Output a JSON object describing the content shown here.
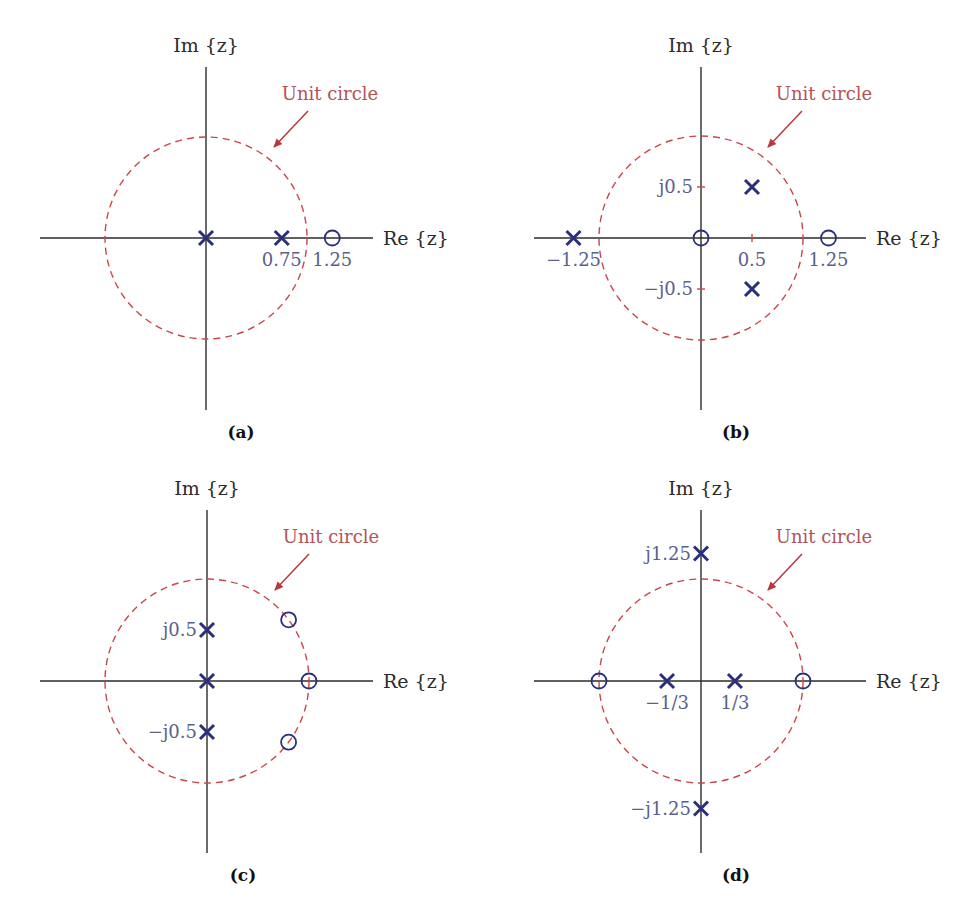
{
  "figure": {
    "panels": [
      {
        "id": "a",
        "caption": "(a)",
        "origin": [
          206,
          238
        ],
        "scale": 101,
        "v_axis": [
          67,
          410
        ],
        "h_axis": [
          40,
          373
        ],
        "im_label": "Im {z}",
        "re_label": "Re {z}",
        "circle_label": "Unit circle",
        "label_pos": [
          330,
          100
        ],
        "arrow": [
          308,
          111,
          274,
          147
        ],
        "caption_pos": [
          241,
          438
        ],
        "ticks": [],
        "poles": [
          [
            0,
            0
          ],
          [
            0.75,
            0
          ]
        ],
        "zeros": [
          [
            1.25,
            0
          ]
        ],
        "labels": [
          {
            "text": "0.75",
            "re": 0.75,
            "im": 0,
            "dx": 0,
            "dy": 28,
            "anchor": "middle"
          },
          {
            "text": "1.25",
            "re": 1.25,
            "im": 0,
            "dx": 0,
            "dy": 28,
            "anchor": "middle"
          }
        ]
      },
      {
        "id": "b",
        "caption": "(b)",
        "origin": [
          701,
          238
        ],
        "scale": 102,
        "v_axis": [
          67,
          410
        ],
        "h_axis": [
          534,
          866
        ],
        "im_label": "Im {z}",
        "re_label": "Re {z}",
        "circle_label": "Unit circle",
        "label_pos": [
          824,
          100
        ],
        "arrow": [
          802,
          111,
          768,
          147
        ],
        "caption_pos": [
          736,
          438
        ],
        "ticks": [
          [
            0,
            0.5,
            "v"
          ],
          [
            0,
            -0.5,
            "v"
          ],
          [
            0.5,
            0,
            "h"
          ]
        ],
        "poles": [
          [
            -1.25,
            0
          ],
          [
            0.5,
            0.5
          ],
          [
            0.5,
            -0.5
          ]
        ],
        "zeros": [
          [
            0,
            0
          ],
          [
            1.25,
            0
          ]
        ],
        "labels": [
          {
            "text": "−1.25",
            "re": -1.25,
            "im": 0,
            "dx": 0,
            "dy": 28,
            "anchor": "middle"
          },
          {
            "text": "0.5",
            "re": 0.5,
            "im": 0,
            "dx": 0,
            "dy": 28,
            "anchor": "middle"
          },
          {
            "text": "1.25",
            "re": 1.25,
            "im": 0,
            "dx": 0,
            "dy": 28,
            "anchor": "middle"
          },
          {
            "text": "j0.5",
            "re": 0,
            "im": 0.5,
            "dx": -8,
            "dy": 6,
            "anchor": "end"
          },
          {
            "text": "−j0.5",
            "re": 0,
            "im": -0.5,
            "dx": -8,
            "dy": 6,
            "anchor": "end"
          }
        ]
      },
      {
        "id": "c",
        "caption": "(c)",
        "origin": [
          207,
          681
        ],
        "scale": 102,
        "v_axis": [
          510,
          853
        ],
        "h_axis": [
          40,
          373
        ],
        "im_label": "Im {z}",
        "re_label": "Re {z}",
        "circle_label": "Unit circle",
        "label_pos": [
          331,
          543
        ],
        "arrow": [
          309,
          554,
          275,
          590
        ],
        "caption_pos": [
          243,
          881
        ],
        "ticks": [],
        "poles": [
          [
            0,
            0.5
          ],
          [
            0,
            0
          ],
          [
            0,
            -0.5
          ]
        ],
        "zeros": [
          [
            0.8,
            0.6
          ],
          [
            1,
            0
          ],
          [
            0.8,
            -0.6
          ]
        ],
        "labels": [
          {
            "text": "j0.5",
            "re": 0,
            "im": 0.5,
            "dx": -10,
            "dy": 6,
            "anchor": "end"
          },
          {
            "text": "−j0.5",
            "re": 0,
            "im": -0.5,
            "dx": -10,
            "dy": 6,
            "anchor": "end"
          }
        ]
      },
      {
        "id": "d",
        "caption": "(d)",
        "origin": [
          701,
          681
        ],
        "scale": 102,
        "v_axis": [
          510,
          853
        ],
        "h_axis": [
          534,
          866
        ],
        "im_label": "Im {z}",
        "re_label": "Re {z}",
        "circle_label": "Unit circle",
        "label_pos": [
          824,
          543
        ],
        "arrow": [
          802,
          554,
          768,
          590
        ],
        "caption_pos": [
          736,
          881
        ],
        "ticks": [],
        "poles": [
          [
            0,
            1.25
          ],
          [
            -0.333,
            0
          ],
          [
            0.333,
            0
          ],
          [
            0,
            -1.25
          ]
        ],
        "zeros": [
          [
            -1,
            0
          ],
          [
            1,
            0
          ]
        ],
        "labels": [
          {
            "text": "−1/3",
            "re": -0.333,
            "im": 0,
            "dx": 0,
            "dy": 28,
            "anchor": "middle"
          },
          {
            "text": "1/3",
            "re": 0.333,
            "im": 0,
            "dx": 0,
            "dy": 28,
            "anchor": "middle"
          },
          {
            "text": "j1.25",
            "re": 0,
            "im": 1.25,
            "dx": -10,
            "dy": 6,
            "anchor": "end"
          },
          {
            "text": "−j1.25",
            "re": 0,
            "im": -1.25,
            "dx": -10,
            "dy": 6,
            "anchor": "end"
          }
        ]
      }
    ],
    "colors": {
      "axis": "#2b2b2b",
      "unit_circle": "#c8474a",
      "markers": "#2a2f7a",
      "value_labels": "#5a5f8c",
      "circle_label": "#b0545a"
    },
    "legend": {
      "pole_symbol": "×",
      "zero_symbol": "○"
    }
  }
}
